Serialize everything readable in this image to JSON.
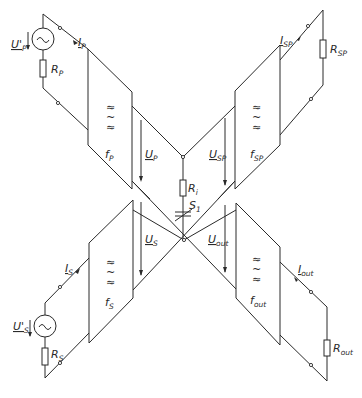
{
  "diagram": {
    "type": "circuit-schematic",
    "converters": [
      {
        "id": "fp",
        "label": "f",
        "sub": "P",
        "symbols": [
          "≈",
          "~",
          "≈"
        ]
      },
      {
        "id": "fsp",
        "label": "f",
        "sub": "SP",
        "symbols": [
          "≈",
          "~",
          "≈"
        ]
      },
      {
        "id": "fs",
        "label": "f",
        "sub": "S",
        "symbols": [
          "≈",
          "~",
          "≈"
        ]
      },
      {
        "id": "fout",
        "label": "f",
        "sub": "out",
        "symbols": [
          "≈",
          "~",
          "≈"
        ]
      }
    ],
    "sources": [
      {
        "id": "source_p",
        "voltage": "U'",
        "voltage_sub": "P",
        "resistor": "R",
        "resistor_sub": "P",
        "current": "I",
        "current_sub": "P",
        "symbol": "~"
      },
      {
        "id": "source_s",
        "voltage": "U'",
        "voltage_sub": "S",
        "resistor": "R",
        "resistor_sub": "S",
        "current": "I",
        "current_sub": "S",
        "symbol": "~"
      }
    ],
    "loads": [
      {
        "id": "load_sp",
        "resistor": "R",
        "resistor_sub": "SP",
        "current": "I",
        "current_sub": "SP"
      },
      {
        "id": "load_out",
        "resistor": "R",
        "resistor_sub": "out",
        "current": "I",
        "current_sub": "out"
      }
    ],
    "voltages": [
      {
        "id": "up",
        "label": "U",
        "sub": "P"
      },
      {
        "id": "usp",
        "label": "U",
        "sub": "SP"
      },
      {
        "id": "us",
        "label": "U",
        "sub": "S"
      },
      {
        "id": "uout",
        "label": "U",
        "sub": "out"
      }
    ],
    "center": {
      "resistor": "R",
      "resistor_sub": "i",
      "switch": "S",
      "switch_sub": "1"
    }
  }
}
